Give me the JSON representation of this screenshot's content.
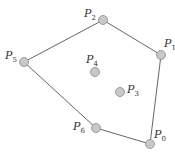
{
  "diagram": {
    "colors": {
      "edge": "#666666",
      "point_fill": "#c8c8c8",
      "point_stroke": "#8a8a8a",
      "label": "#333333"
    },
    "points": [
      {
        "id": "P0",
        "letter": "P",
        "sub": "0",
        "x": 150,
        "y": 144,
        "lx": 154,
        "ly": 138,
        "on_hull": true
      },
      {
        "id": "P1",
        "letter": "P",
        "sub": "1",
        "x": 161,
        "y": 55,
        "lx": 164,
        "ly": 47,
        "on_hull": true
      },
      {
        "id": "P2",
        "letter": "P",
        "sub": "2",
        "x": 103,
        "y": 20,
        "lx": 84,
        "ly": 17,
        "on_hull": true
      },
      {
        "id": "P3",
        "letter": "P",
        "sub": "3",
        "x": 120,
        "y": 92,
        "lx": 127,
        "ly": 93,
        "on_hull": false
      },
      {
        "id": "P4",
        "letter": "P",
        "sub": "4",
        "x": 95,
        "y": 72,
        "lx": 86,
        "ly": 63,
        "on_hull": false
      },
      {
        "id": "P5",
        "letter": "P",
        "sub": "5",
        "x": 24,
        "y": 62,
        "lx": 5,
        "ly": 59,
        "on_hull": true
      },
      {
        "id": "P6",
        "letter": "P",
        "sub": "6",
        "x": 96,
        "y": 128,
        "lx": 73,
        "ly": 130,
        "on_hull": true
      }
    ],
    "hull_order": [
      "P0",
      "P1",
      "P2",
      "P5",
      "P6"
    ]
  }
}
